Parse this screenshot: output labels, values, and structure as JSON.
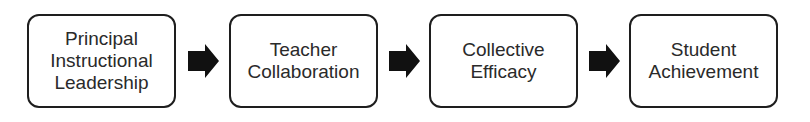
{
  "diagram": {
    "type": "flowchart",
    "direction": "left-to-right",
    "nodes": [
      {
        "id": "n1",
        "label": "Principal\nInstructional\nLeadership"
      },
      {
        "id": "n2",
        "label": "Teacher\nCollaboration"
      },
      {
        "id": "n3",
        "label": "Collective\nEfficacy"
      },
      {
        "id": "n4",
        "label": "Student\nAchievement"
      }
    ],
    "edges": [
      {
        "from": "n1",
        "to": "n2",
        "icon": "right-arrow-icon"
      },
      {
        "from": "n2",
        "to": "n3",
        "icon": "right-arrow-icon"
      },
      {
        "from": "n3",
        "to": "n4",
        "icon": "right-arrow-icon"
      }
    ],
    "colors": {
      "border": "#1e1e1e",
      "arrow": "#111111",
      "text": "#2a2a2a",
      "background": "#ffffff"
    }
  }
}
